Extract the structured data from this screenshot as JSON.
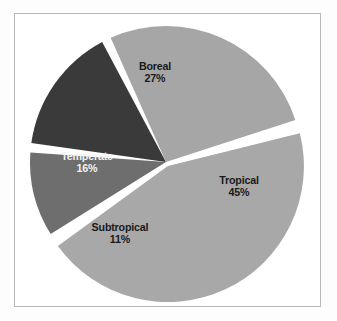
{
  "figure": {
    "background_color": "#ffffff",
    "frame_color": "#b9b9b9",
    "separator_color": "#ffffff"
  },
  "chart_data": {
    "type": "pie",
    "title": "",
    "subtitle": "",
    "xlabel": "",
    "ylabel": "",
    "legend_position": "none",
    "grid": false,
    "labels_on_slices": true,
    "categories": [
      "Tropical",
      "Subtropical",
      "Temperate",
      "Boreal"
    ],
    "values": [
      45,
      11,
      16,
      27
    ],
    "unit": "%",
    "total": 99,
    "slices": [
      {
        "name": "Tropical",
        "label": "Tropical",
        "value": 45,
        "value_text": "45%",
        "color": "#a8a8a8",
        "label_color": "#1a1a1a",
        "exploded": true,
        "start_angle_deg": -16,
        "end_angle_deg": 146
      },
      {
        "name": "Subtropical",
        "label": "Subtropical",
        "value": 11,
        "value_text": "11%",
        "color": "#6e6e6e",
        "label_color": "#1a1a1a",
        "exploded": false,
        "start_angle_deg": 146,
        "end_angle_deg": 186
      },
      {
        "name": "Temperate",
        "label": "Temperate",
        "value": 16,
        "value_text": "16%",
        "color": "#3a3a3a",
        "label_color": "#f2f2f2",
        "exploded": false,
        "start_angle_deg": 186,
        "end_angle_deg": 244
      },
      {
        "name": "Boreal",
        "label": "Boreal",
        "value": 27,
        "value_text": "27%",
        "color": "#a6a6a6",
        "label_color": "#1a1a1a",
        "exploded": false,
        "start_angle_deg": 244,
        "end_angle_deg": 344
      }
    ]
  }
}
